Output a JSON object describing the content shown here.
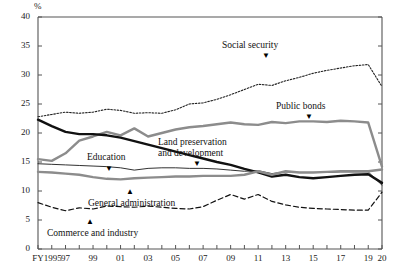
{
  "chart_data": {
    "type": "line",
    "title": "",
    "subtitle": "",
    "xlabel": "",
    "ylabel": "",
    "unit_label": "%",
    "ylim": [
      0,
      40
    ],
    "ytick_values": [
      0,
      5,
      10,
      15,
      20,
      25,
      30,
      35,
      40
    ],
    "ytick_labels": [
      "0",
      "5",
      "10",
      "15",
      "20",
      "25",
      "30",
      "35",
      "40"
    ],
    "grid": false,
    "legend_position": "inline-annotations",
    "x": [
      1995,
      1996,
      1997,
      1998,
      1999,
      2000,
      2001,
      2002,
      2003,
      2004,
      2005,
      2006,
      2007,
      2008,
      2009,
      2010,
      2011,
      2012,
      2013,
      2014,
      2015,
      2016,
      2017,
      2018,
      2019,
      2020
    ],
    "xtick_labels": [
      "FY1995",
      "",
      "97",
      "",
      "99",
      "",
      "01",
      "",
      "03",
      "",
      "05",
      "",
      "07",
      "",
      "09",
      "",
      "11",
      "",
      "13",
      "",
      "15",
      "",
      "17",
      "",
      "19",
      "20"
    ],
    "xlim": [
      1995,
      2020
    ],
    "series": [
      {
        "name": "Social security",
        "style": "dotted",
        "color": "#222222",
        "width": 1.1,
        "values": [
          22.8,
          23.2,
          23.6,
          23.4,
          23.6,
          24.1,
          23.9,
          23.4,
          23.5,
          23.4,
          24.0,
          25.0,
          25.2,
          25.8,
          26.6,
          27.5,
          28.4,
          28.2,
          29.0,
          29.6,
          30.3,
          30.8,
          31.2,
          31.6,
          31.8,
          28.0
        ]
      },
      {
        "name": "Public bonds",
        "style": "solid",
        "color": "#8c8c8c",
        "width": 2.4,
        "values": [
          15.5,
          15.2,
          16.5,
          18.7,
          19.4,
          20.2,
          19.6,
          20.8,
          19.4,
          20.0,
          20.6,
          21.0,
          21.2,
          21.5,
          21.8,
          21.5,
          21.4,
          21.9,
          21.7,
          22.0,
          22.0,
          21.9,
          22.1,
          22.0,
          21.8,
          14.2
        ]
      },
      {
        "name": "Land preservation and development",
        "style": "solid",
        "color": "#111111",
        "width": 2.4,
        "values": [
          22.3,
          21.2,
          20.2,
          19.8,
          19.8,
          19.6,
          19.2,
          18.6,
          18.0,
          17.4,
          16.8,
          16.2,
          15.6,
          15.0,
          14.5,
          13.8,
          13.2,
          12.5,
          12.8,
          12.4,
          12.2,
          12.4,
          12.6,
          12.8,
          12.9,
          11.4
        ]
      },
      {
        "name": "Education",
        "style": "solid",
        "color": "#1a1a1a",
        "width": 0.9,
        "values": [
          14.7,
          14.6,
          14.5,
          14.4,
          14.3,
          14.2,
          14.0,
          13.6,
          13.9,
          14.0,
          14.0,
          13.9,
          13.9,
          13.8,
          13.6,
          13.4,
          13.5,
          13.0,
          13.3,
          13.2,
          13.2,
          13.2,
          13.3,
          13.3,
          13.3,
          11.0
        ]
      },
      {
        "name": "General administration",
        "style": "solid",
        "color": "#8c8c8c",
        "width": 2.4,
        "values": [
          13.3,
          13.2,
          13.0,
          12.8,
          12.4,
          12.1,
          12.0,
          12.2,
          12.3,
          12.4,
          12.5,
          12.5,
          12.6,
          12.6,
          12.6,
          12.8,
          13.4,
          12.8,
          13.4,
          13.2,
          13.2,
          13.3,
          13.4,
          13.4,
          13.4,
          13.7
        ]
      },
      {
        "name": "Commerce and industry",
        "style": "dashed",
        "color": "#111111",
        "width": 1.2,
        "values": [
          8.0,
          7.2,
          6.6,
          7.1,
          6.9,
          7.4,
          7.3,
          7.2,
          7.4,
          7.2,
          7.0,
          6.9,
          7.3,
          8.4,
          9.4,
          8.6,
          9.4,
          8.2,
          7.6,
          7.2,
          7.0,
          6.9,
          6.8,
          6.7,
          6.7,
          9.8
        ]
      }
    ],
    "annotations": [
      {
        "text": "Social security",
        "pointer": "down",
        "name": "social-security"
      },
      {
        "text": "Public bonds",
        "pointer": "down",
        "name": "public-bonds"
      },
      {
        "text_line1": "Land preservation",
        "text_line2": "and development",
        "pointer": "down",
        "name": "land-preservation-and-development"
      },
      {
        "text": "Education",
        "pointer": "down",
        "name": "education"
      },
      {
        "text": "General administration",
        "pointer": "up",
        "name": "general-administration"
      },
      {
        "text": "Commerce and industry",
        "pointer": "up",
        "name": "commerce-and-industry"
      }
    ]
  }
}
